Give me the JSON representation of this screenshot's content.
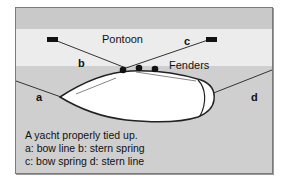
{
  "diagram": {
    "labels": {
      "pontoon": "Pontoon",
      "fenders": "Fenders",
      "a": "a",
      "b": "b",
      "c": "c",
      "d": "d"
    },
    "caption": {
      "line1": "A yacht properly tied up.",
      "line2": "a: bow line  b: stern spring",
      "line3": "c: bow spring  d: stern line"
    },
    "colors": {
      "top_band": "#c9c9c9",
      "pontoon_band": "#ececec",
      "water": "#cfcfcf",
      "hull": "#ffffff",
      "lines": "#333333"
    }
  }
}
